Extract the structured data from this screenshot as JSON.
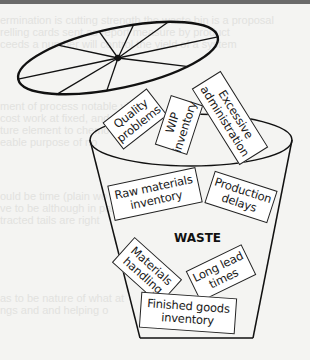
{
  "figure": {
    "center_label": "WASTE",
    "labels": [
      {
        "id": "quality-problems",
        "text": "Quality problems"
      },
      {
        "id": "wip-inventory",
        "text": "WIP inventory"
      },
      {
        "id": "excessive-administration",
        "text": "Excessive administration"
      },
      {
        "id": "raw-materials-inventory",
        "text": "Raw materials inventory"
      },
      {
        "id": "production-delays",
        "text": "Production delays"
      },
      {
        "id": "materials-handling",
        "text": "Materials handling"
      },
      {
        "id": "long-lead-times",
        "text": "Long lead times"
      },
      {
        "id": "finished-goods-inventory",
        "text": "Finished goods inventory"
      }
    ],
    "colors": {
      "line": "#111111",
      "box_fill": "#ffffff",
      "background": "#f4f4f2"
    }
  }
}
